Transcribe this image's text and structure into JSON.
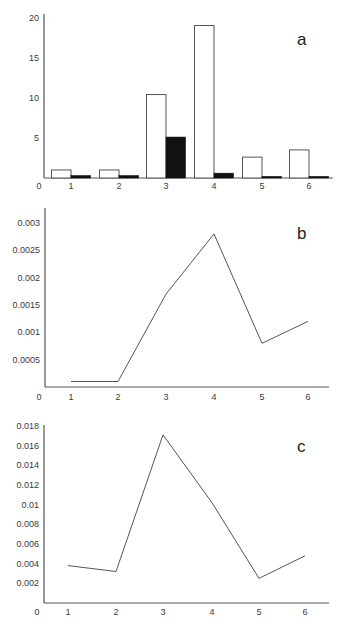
{
  "chart_data": [
    {
      "panel": "a",
      "type": "bar",
      "title": "",
      "xlabel": "",
      "ylabel": "",
      "categories": [
        "1",
        "2",
        "3",
        "4",
        "5",
        "6"
      ],
      "series": [
        {
          "name": "white bars",
          "color": "#ffffff",
          "values": [
            1.0,
            1.0,
            10.4,
            19.0,
            2.6,
            3.5
          ]
        },
        {
          "name": "black bars",
          "color": "#111111",
          "values": [
            0.3,
            0.3,
            5.1,
            0.6,
            0.2,
            0.2
          ]
        }
      ],
      "ylim": [
        0,
        20
      ],
      "yticks": [
        "0",
        "5",
        "10",
        "15",
        "20"
      ],
      "grid": false,
      "legend": "none",
      "annotation": "a"
    },
    {
      "panel": "b",
      "type": "line",
      "title": "",
      "xlabel": "",
      "ylabel": "",
      "x": [
        1,
        2,
        3,
        4,
        5,
        6
      ],
      "series": [
        {
          "name": "series",
          "values": [
            0.0001,
            0.0001,
            0.0017,
            0.0028,
            0.0008,
            0.0012
          ]
        }
      ],
      "ylim": [
        0,
        0.003
      ],
      "yticks": [
        "0",
        "0.0005",
        "0.001",
        "0.0015",
        "0.002",
        "0.0025",
        "0.003"
      ],
      "xticks": [
        "1",
        "2",
        "3",
        "4",
        "5",
        "6"
      ],
      "grid": false,
      "legend": "none",
      "annotation": "b"
    },
    {
      "panel": "c",
      "type": "line",
      "title": "",
      "xlabel": "",
      "ylabel": "",
      "x": [
        1,
        2,
        3,
        4,
        5,
        6
      ],
      "series": [
        {
          "name": "series",
          "values": [
            0.0038,
            0.0032,
            0.0171,
            0.0102,
            0.0025,
            0.0048
          ]
        }
      ],
      "ylim": [
        0,
        0.018
      ],
      "yticks": [
        "0",
        "0.002",
        "0.004",
        "0.006",
        "0.008",
        "0.01",
        "0.012",
        "0.014",
        "0.016",
        "0.018"
      ],
      "xticks": [
        "1",
        "2",
        "3",
        "4",
        "5",
        "6"
      ],
      "grid": false,
      "legend": "none",
      "annotation": "c"
    }
  ]
}
